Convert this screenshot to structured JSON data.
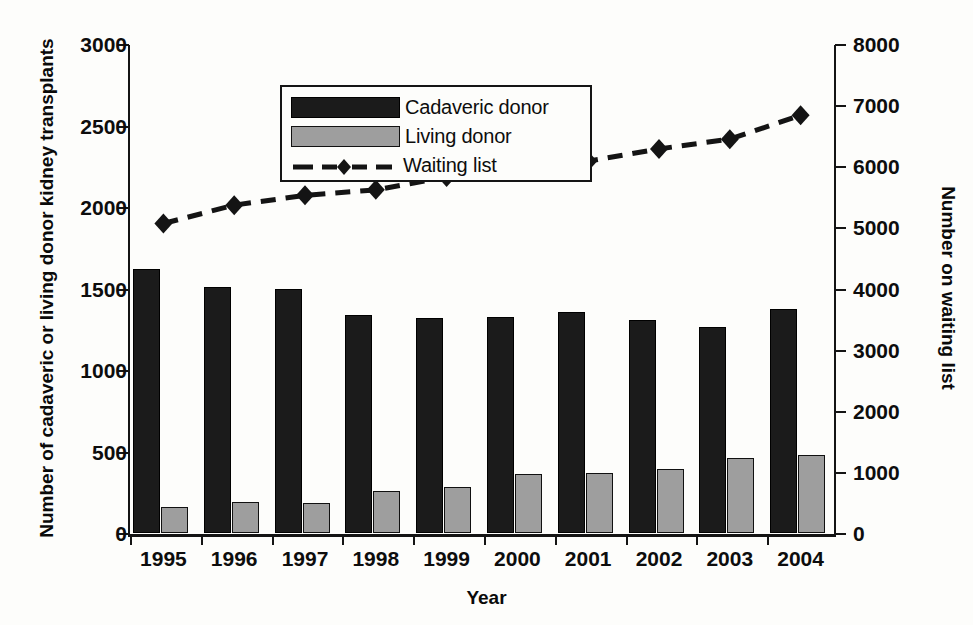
{
  "chart_data": {
    "type": "bar",
    "title": "",
    "xlabel": "Year",
    "ylabel": "Number of cadaveric or living donor kidney transplants",
    "ylabel_right": "Number on waiting list",
    "categories": [
      "1995",
      "1996",
      "1997",
      "1998",
      "1999",
      "2000",
      "2001",
      "2002",
      "2003",
      "2004"
    ],
    "ylim": [
      0,
      3000
    ],
    "yticks": [
      0,
      500,
      1000,
      1500,
      2000,
      2500,
      3000
    ],
    "ylim_right": [
      0,
      8000
    ],
    "yticks_right": [
      0,
      1000,
      2000,
      3000,
      4000,
      5000,
      6000,
      7000,
      8000
    ],
    "grid": false,
    "legend_position": "upper-left-inside",
    "series": [
      {
        "name": "Cadaveric donor",
        "kind": "bar",
        "axis": "left",
        "color": "#1b1b1b",
        "values": [
          1620,
          1510,
          1495,
          1340,
          1320,
          1325,
          1355,
          1305,
          1265,
          1375
        ]
      },
      {
        "name": "Living donor",
        "kind": "bar",
        "axis": "left",
        "color": "#9e9e9e",
        "values": [
          160,
          190,
          185,
          255,
          280,
          360,
          370,
          390,
          460,
          480
        ]
      },
      {
        "name": "Waiting list",
        "kind": "line-dashed-diamond",
        "axis": "right",
        "color": "#141414",
        "values": [
          5080,
          5380,
          5540,
          5630,
          5840,
          6020,
          6100,
          6300,
          6460,
          6850
        ]
      }
    ]
  },
  "legend": {
    "items": [
      {
        "label": "Cadaveric donor",
        "marker": "filled-black-rect"
      },
      {
        "label": "Living donor",
        "marker": "filled-gray-rect"
      },
      {
        "label": "Waiting list",
        "marker": "dashed-line-diamond"
      }
    ]
  },
  "axes": {
    "x_title": "Year",
    "y_title_left": "Number of cadaveric or living donor kidney transplants",
    "y_title_right": "Number on waiting list"
  }
}
